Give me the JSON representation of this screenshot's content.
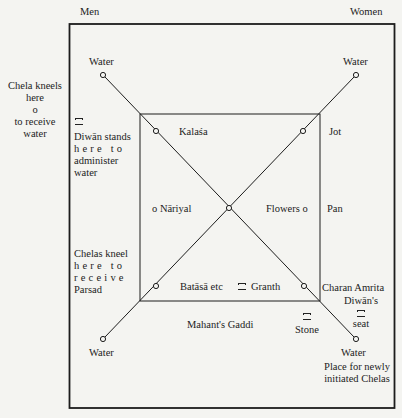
{
  "header": {
    "left": "Men",
    "right": "Women"
  },
  "corners": {
    "top_left_water": "Water",
    "top_right_water": "Water",
    "bottom_left_water": "Water",
    "bottom_right_water": "Water",
    "bottom_right_note": [
      "Place for newly",
      "initiated Chelas"
    ]
  },
  "left_notes": {
    "chela_kneels": [
      "Chela kneels",
      "here"
    ],
    "chela_circle": "o",
    "chela_receive": [
      "to receive",
      "water"
    ],
    "diwan_stands": [
      "Diwān stands",
      "here to",
      "administer",
      "water"
    ],
    "chelas_kneel": [
      "Chelas kneel",
      "here to",
      "receive",
      "Parsad"
    ]
  },
  "inner": {
    "kalasa": "Kalaśa",
    "jot": "Jot",
    "nariyal": "o Nāriyal",
    "flowers": "Flowers o",
    "pan": "Pan",
    "batasa": "Batāsā etc",
    "granth": "Granth",
    "charan_amrita": "Charan Amrita"
  },
  "bottom": {
    "mahants_gaddi": "Mahant's Gaddi",
    "stone": "Stone",
    "diwans": "Diwān's",
    "seat": "seat"
  }
}
